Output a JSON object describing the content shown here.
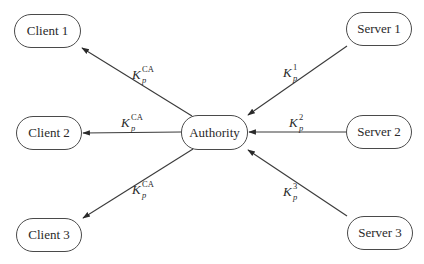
{
  "diagram": {
    "type": "star-topology key distribution",
    "colors": {
      "stroke": "#3a3a3a",
      "node_border": "#4a4a4a",
      "text": "#2a2a2a",
      "background": "#ffffff"
    },
    "nodes": {
      "client1": {
        "label": "Client 1"
      },
      "client2": {
        "label": "Client 2"
      },
      "client3": {
        "label": "Client 3"
      },
      "authority": {
        "label": "Authority"
      },
      "server1": {
        "label": "Server 1"
      },
      "server2": {
        "label": "Server 2"
      },
      "server3": {
        "label": "Server 3"
      }
    },
    "edges": {
      "auth_to_client1": {
        "from": "Authority",
        "to": "Client 1",
        "base": "K",
        "sup": "CA",
        "sub": "p"
      },
      "auth_to_client2": {
        "from": "Authority",
        "to": "Client 2",
        "base": "K",
        "sup": "CA",
        "sub": "p"
      },
      "auth_to_client3": {
        "from": "Authority",
        "to": "Client 3",
        "base": "K",
        "sup": "CA",
        "sub": "p"
      },
      "server1_to_auth": {
        "from": "Server 1",
        "to": "Authority",
        "base": "K",
        "sup": "1",
        "sub": "p"
      },
      "server2_to_auth": {
        "from": "Server 2",
        "to": "Authority",
        "base": "K",
        "sup": "2",
        "sub": "p"
      },
      "server3_to_auth": {
        "from": "Server 3",
        "to": "Authority",
        "base": "K",
        "sup": "3",
        "sub": "p"
      }
    }
  }
}
